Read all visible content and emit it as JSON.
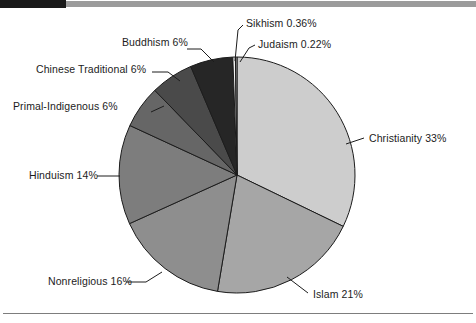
{
  "decor": {
    "top_bar_black_color": "#1a1a1a",
    "top_bar_gray_color": "#9b9b9b",
    "bottom_rule_color": "#7d7d7d",
    "background_color": "#ffffff"
  },
  "chart_data": {
    "type": "pie",
    "title": "",
    "subtitle": "",
    "xlabel": "",
    "ylabel": "",
    "legend_position": "none",
    "grid": false,
    "start_angle_deg": 0,
    "direction": "clockwise",
    "units": "percent",
    "center": {
      "x": 237,
      "y": 175
    },
    "radius": 118,
    "categories": [
      "Christianity",
      "Islam",
      "Nonreligious",
      "Hinduism",
      "Primal-Indigenous",
      "Chinese Traditional",
      "Buddhism",
      "Sikhism",
      "Judaism"
    ],
    "values": [
      33,
      21,
      16,
      14,
      6,
      6,
      6,
      0.36,
      0.22
    ],
    "labels": [
      "Christianity 33%",
      "Islam 21%",
      "Nonreligious 16%",
      "Hinduism 14%",
      "Primal-Indigenous 6%",
      "Chinese Traditional 6%",
      "Buddhism 6%",
      "Sikhism 0.36%",
      "Judaism 0.22%"
    ],
    "colors": [
      "#cdcdcd",
      "#a6a6a6",
      "#8e8e8e",
      "#7d7d7d",
      "#666666",
      "#4a4a4a",
      "#262626",
      "#f2f2f2",
      "#b5b5b5"
    ],
    "slice_border_color": "#1c1c1c",
    "label_color": "#1c1c1c",
    "leader_line_color": "#1c1c1c"
  }
}
